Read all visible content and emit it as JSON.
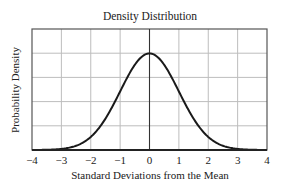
{
  "chart_data": {
    "type": "line",
    "title": "Density Distribution",
    "xlabel": "Standard Deviations from the Mean",
    "ylabel": "Probability Density",
    "xlim": [
      -4,
      4
    ],
    "ylim": [
      0,
      0.5
    ],
    "x_ticks": [
      -4,
      -3,
      -2,
      -1,
      0,
      1,
      2,
      3,
      4
    ],
    "x_tick_labels": [
      "−4",
      "−3",
      "−2",
      "−1",
      "0",
      "1",
      "2",
      "3",
      "4"
    ],
    "y_gridlines": [
      0.1,
      0.2,
      0.3,
      0.4
    ],
    "y_tick_labels_shown": false,
    "grid": true,
    "series": [
      {
        "name": "Standard normal density",
        "function": "normal_pdf",
        "mean": 0,
        "sd": 1,
        "x": [
          -4,
          -3.5,
          -3,
          -2.5,
          -2,
          -1.5,
          -1,
          -0.5,
          0,
          0.5,
          1,
          1.5,
          2,
          2.5,
          3,
          3.5,
          4
        ],
        "y": [
          0.0001,
          0.0009,
          0.0044,
          0.0175,
          0.054,
          0.1295,
          0.242,
          0.3521,
          0.3989,
          0.3521,
          0.242,
          0.1295,
          0.054,
          0.0175,
          0.0044,
          0.0009,
          0.0001
        ]
      }
    ],
    "legend": "none"
  }
}
